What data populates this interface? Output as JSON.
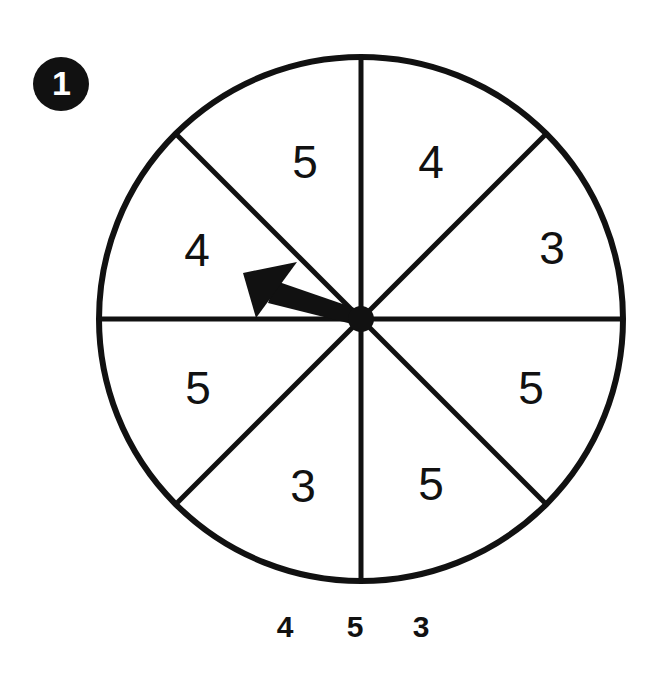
{
  "page": {
    "background_color": "#ffffff",
    "ink_color": "#111111",
    "width": 669,
    "height": 673
  },
  "badge": {
    "label": "1",
    "shape": "filled-circle",
    "fill_color": "#111111",
    "text_color": "#ffffff"
  },
  "spinner": {
    "name": "eight-sector-spinner",
    "center_x": 361,
    "center_y": 319,
    "radius": 262,
    "stroke_color": "#111111",
    "stroke_width": 6,
    "hub_radius": 13,
    "sector_count": 8,
    "divider_angles_deg": [
      0,
      45,
      90,
      135
    ],
    "pointer": {
      "name": "spinner-arrow",
      "angle_deg": 159,
      "length": 124,
      "points_to_sector_index": 6,
      "points_to_value": "4"
    },
    "sectors": [
      {
        "index": 0,
        "value": "5",
        "start_deg": 90,
        "end_deg": 135,
        "label_x": 305,
        "label_y": 162
      },
      {
        "index": 1,
        "value": "4",
        "start_deg": 45,
        "end_deg": 90,
        "label_x": 431,
        "label_y": 162
      },
      {
        "index": 2,
        "value": "3",
        "start_deg": 0,
        "end_deg": 45,
        "label_x": 552,
        "label_y": 248
      },
      {
        "index": 3,
        "value": "5",
        "start_deg": 315,
        "end_deg": 360,
        "label_x": 531,
        "label_y": 388
      },
      {
        "index": 4,
        "value": "5",
        "start_deg": 270,
        "end_deg": 315,
        "label_x": 431,
        "label_y": 484
      },
      {
        "index": 5,
        "value": "3",
        "start_deg": 225,
        "end_deg": 270,
        "label_x": 303,
        "label_y": 486
      },
      {
        "index": 6,
        "value": "5",
        "start_deg": 180,
        "end_deg": 225,
        "label_x": 198,
        "label_y": 388
      },
      {
        "index": 7,
        "value": "4",
        "start_deg": 135,
        "end_deg": 180,
        "label_x": 197,
        "label_y": 250
      }
    ]
  },
  "axis_labels": {
    "name": "outcome-key",
    "items": [
      {
        "text": "4",
        "x": 285,
        "y": 626
      },
      {
        "text": "5",
        "x": 355,
        "y": 626
      },
      {
        "text": "3",
        "x": 421,
        "y": 626
      }
    ]
  }
}
